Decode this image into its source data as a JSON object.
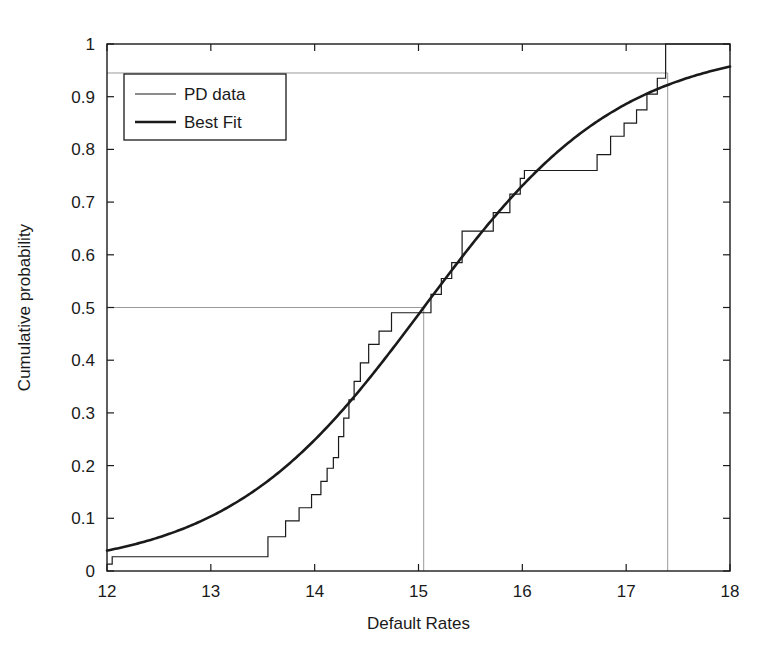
{
  "chart_data": {
    "type": "line",
    "title": "",
    "xlabel": "Default Rates",
    "ylabel": "Cumulative probability",
    "xlim": [
      12,
      18
    ],
    "ylim": [
      0,
      1
    ],
    "xticks": [
      12,
      13,
      14,
      15,
      16,
      17,
      18
    ],
    "xtick_labels": [
      "12",
      "13",
      "14",
      "15",
      "16",
      "17",
      "18"
    ],
    "yticks": [
      0,
      0.1,
      0.2,
      0.3,
      0.4,
      0.5,
      0.6,
      0.7,
      0.8,
      0.9,
      1
    ],
    "ytick_labels": [
      "0",
      "0.1",
      "0.2",
      "0.3",
      "0.4",
      "0.5",
      "0.6",
      "0.7",
      "0.8",
      "0.9",
      "1"
    ],
    "grid": false,
    "legend_position": "upper left",
    "legend_entries": [
      {
        "name": "PD data",
        "style": "thin-step",
        "color": "#1a1a1a",
        "width": 1.2
      },
      {
        "name": "Best Fit",
        "style": "thick-smooth",
        "color": "#1a1a1a",
        "width": 2.6
      }
    ],
    "series": [
      {
        "name": "PD data",
        "type": "step",
        "x": [
          12.0,
          12.05,
          13.1,
          13.55,
          13.72,
          13.85,
          13.97,
          14.06,
          14.12,
          14.18,
          14.23,
          14.28,
          14.33,
          14.38,
          14.44,
          14.52,
          14.62,
          14.74,
          15.05,
          15.12,
          15.22,
          15.32,
          15.42,
          15.58,
          15.72,
          15.88,
          15.98,
          16.02,
          16.55,
          16.72,
          16.85,
          16.98,
          17.1,
          17.2,
          17.3,
          17.38,
          18.0
        ],
        "y": [
          0.013,
          0.027,
          0.027,
          0.065,
          0.095,
          0.12,
          0.145,
          0.17,
          0.195,
          0.215,
          0.255,
          0.29,
          0.325,
          0.36,
          0.395,
          0.43,
          0.455,
          0.49,
          0.49,
          0.525,
          0.555,
          0.585,
          0.645,
          0.645,
          0.68,
          0.715,
          0.745,
          0.76,
          0.76,
          0.79,
          0.825,
          0.85,
          0.875,
          0.905,
          0.935,
          1.0,
          1.0
        ]
      },
      {
        "name": "Best Fit",
        "type": "smooth",
        "description": "Logistic / normal CDF fit, median 15.05, scale ~0.95",
        "x": [
          12.0,
          12.2,
          12.4,
          12.6,
          12.8,
          13.0,
          13.2,
          13.4,
          13.6,
          13.8,
          14.0,
          14.2,
          14.4,
          14.6,
          14.8,
          15.0,
          15.05,
          15.2,
          15.4,
          15.6,
          15.8,
          16.0,
          16.2,
          16.4,
          16.6,
          16.8,
          17.0,
          17.2,
          17.4,
          17.6,
          17.8,
          18.0
        ],
        "y": [
          0.012,
          0.019,
          0.028,
          0.04,
          0.056,
          0.077,
          0.103,
          0.137,
          0.178,
          0.228,
          0.287,
          0.353,
          0.424,
          0.497,
          0.57,
          0.64,
          0.5,
          0.672,
          0.73,
          0.782,
          0.827,
          0.865,
          0.896,
          0.921,
          0.94,
          0.954,
          0.965,
          0.973,
          0.979,
          0.982,
          0.984,
          0.985
        ]
      }
    ],
    "reference_lines": [
      {
        "name": "median-horizontal",
        "orientation": "horizontal",
        "y": 0.5,
        "x_from": 12.0,
        "x_to": 15.05
      },
      {
        "name": "median-vertical",
        "orientation": "vertical",
        "x": 15.05,
        "y_from": 0.0,
        "y_to": 0.5
      },
      {
        "name": "upper-quantile-horizontal",
        "orientation": "horizontal",
        "y": 0.945,
        "x_from": 12.0,
        "x_to": 17.4
      },
      {
        "name": "upper-quantile-vertical",
        "orientation": "vertical",
        "x": 17.4,
        "y_from": 0.0,
        "y_to": 0.945
      }
    ],
    "colors": {
      "background": "#ffffff",
      "axis": "#1a1a1a",
      "data_line": "#1a1a1a",
      "fit_line": "#1a1a1a",
      "reference_line": "#9a9a9a"
    }
  }
}
